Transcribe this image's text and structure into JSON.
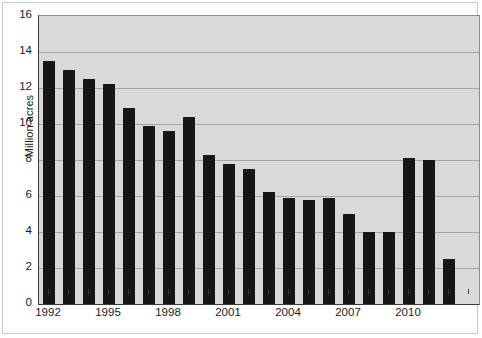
{
  "chart_data": {
    "type": "bar",
    "title": "",
    "subtitle": "",
    "xlabel": "",
    "ylabel": "Million acres",
    "ylim": [
      0,
      16
    ],
    "ytick_step": 2,
    "yticks": [
      "0",
      "2",
      "4",
      "6",
      "8",
      "10",
      "12",
      "14",
      "16"
    ],
    "grid": "horizontal",
    "legend": "none",
    "bar_color": "#161616",
    "plot_background": "#d9d9d9",
    "gridline_color": "#a6a6a6",
    "axis_color": "#3a3a3a",
    "categories": [
      "1992",
      "1993",
      "1994",
      "1995",
      "1996",
      "1997",
      "1998",
      "1999",
      "2000",
      "2001",
      "2002",
      "2003",
      "2004",
      "2005",
      "2006",
      "2007",
      "2008",
      "2009",
      "2010",
      "2011",
      "2012",
      "2013"
    ],
    "xtick_labels": [
      "1992",
      "1995",
      "1998",
      "2001",
      "2004",
      "2007",
      "2010"
    ],
    "values": [
      13.5,
      13.0,
      12.5,
      12.2,
      10.9,
      9.9,
      9.6,
      10.4,
      8.3,
      7.8,
      7.5,
      6.2,
      5.9,
      5.8,
      5.9,
      5.0,
      4.0,
      4.0,
      8.1,
      8.0,
      2.5,
      0
    ]
  }
}
